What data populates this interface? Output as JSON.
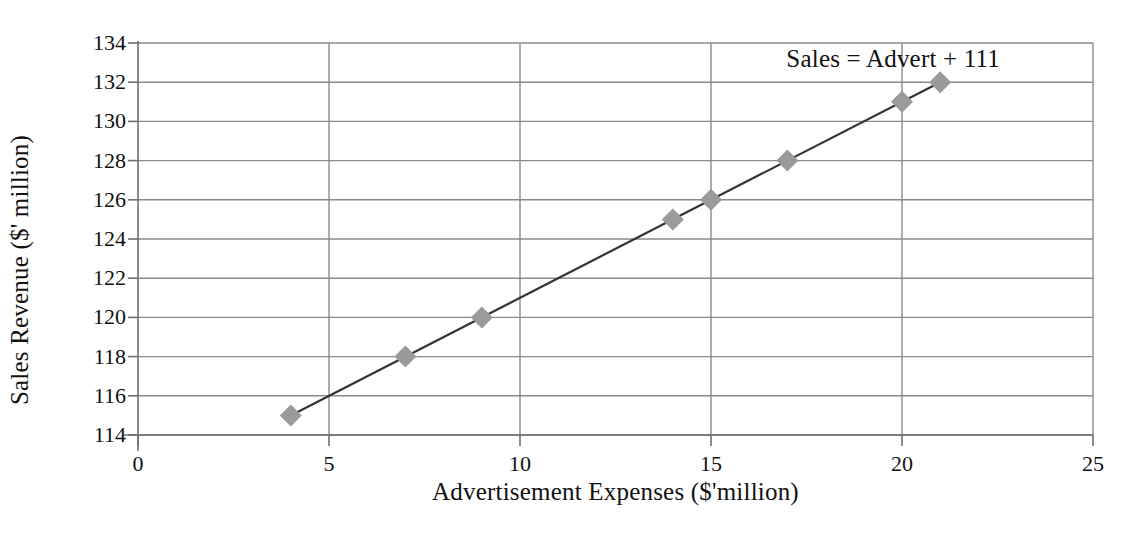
{
  "chart_data": {
    "type": "scatter",
    "title": "",
    "xlabel": "Advertisement Expenses ($'million)",
    "ylabel": "Sales Revenue ($' million)",
    "xlim": [
      0,
      25
    ],
    "ylim": [
      114,
      134
    ],
    "xticks": [
      "0",
      "5",
      "10",
      "15",
      "20",
      "25"
    ],
    "xtick_values": [
      0,
      5,
      10,
      15,
      20,
      25
    ],
    "yticks": [
      "114",
      "116",
      "118",
      "120",
      "122",
      "124",
      "126",
      "128",
      "130",
      "132",
      "134"
    ],
    "ytick_values": [
      114,
      116,
      118,
      120,
      122,
      124,
      126,
      128,
      130,
      132,
      134
    ],
    "grid": "both",
    "legend": "none",
    "annotation": "Sales = Advert + 111",
    "series": [
      {
        "name": "Sales vs Advertisement",
        "marker": "diamond",
        "marker_color": "#9a9a9a",
        "line_color": "#333333",
        "x": [
          4,
          7,
          9,
          14,
          15,
          17,
          20,
          21
        ],
        "y": [
          115,
          118,
          120,
          125,
          126,
          128,
          131,
          132
        ],
        "points": [
          {
            "x": 4,
            "y": 115
          },
          {
            "x": 7,
            "y": 118
          },
          {
            "x": 9,
            "y": 120
          },
          {
            "x": 14,
            "y": 125
          },
          {
            "x": 15,
            "y": 126
          },
          {
            "x": 17,
            "y": 128
          },
          {
            "x": 20,
            "y": 131
          },
          {
            "x": 21,
            "y": 132
          }
        ]
      }
    ],
    "trendline": {
      "equation": "Sales = Advert + 111",
      "slope": 1,
      "intercept": 111,
      "x_start": 4,
      "x_end": 21,
      "color": "#333333"
    }
  },
  "colors": {
    "background": "#ffffff",
    "grid": "#8a8a8a",
    "axis": "#6f6f6f",
    "marker": "#9a9a9a",
    "line": "#333333",
    "text": "#111111"
  }
}
